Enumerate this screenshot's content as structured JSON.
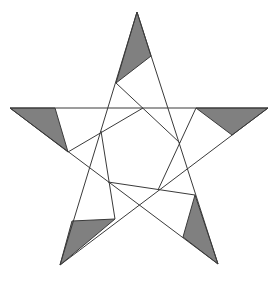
{
  "diagram": {
    "type": "pentagram with inscribed rotated pentagon and shaded tip triangles",
    "shade_color": "#808080",
    "line_color": "#3a3a3a",
    "background": "#ffffff",
    "star_points": [
      [
        137,
        12
      ],
      [
        268,
        108
      ],
      [
        218,
        264
      ],
      [
        60,
        265
      ],
      [
        10,
        108
      ]
    ],
    "inner_segments": [
      [
        [
          116,
          83
        ],
        [
          180,
          143
        ]
      ],
      [
        [
          68,
          152
        ],
        [
          143,
          108
        ]
      ],
      [
        [
          196,
          108
        ],
        [
          158,
          190
        ]
      ],
      [
        [
          195,
          195
        ],
        [
          108,
          182
        ]
      ],
      [
        [
          115,
          219
        ],
        [
          101,
          131
        ]
      ]
    ],
    "shaded_triangles": [
      [
        [
          137,
          12
        ],
        [
          116,
          83
        ],
        [
          151,
          56
        ]
      ],
      [
        [
          10,
          108
        ],
        [
          55,
          108
        ],
        [
          68,
          152
        ]
      ],
      [
        [
          196,
          108
        ],
        [
          268,
          108
        ],
        [
          232,
          135
        ]
      ],
      [
        [
          60,
          265
        ],
        [
          72,
          221
        ],
        [
          115,
          219
        ]
      ],
      [
        [
          195,
          195
        ],
        [
          218,
          264
        ],
        [
          183,
          237
        ]
      ]
    ]
  }
}
